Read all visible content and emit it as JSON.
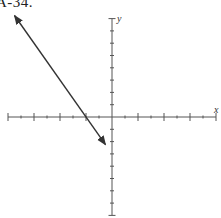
{
  "title": "A-34.",
  "chart_data": {
    "type": "line",
    "title": "A-34.",
    "xlabel": "x",
    "ylabel": "y",
    "xlim": [
      -8,
      8
    ],
    "ylim": [
      -8,
      8
    ],
    "grid": false,
    "tick_spacing": 1,
    "major_tick_every": 2,
    "tick_labels": [],
    "series": [
      {
        "name": "line",
        "equation": "y = -3/2 x - 3",
        "x_intercept": -2,
        "y_intercept": -3,
        "slope": -1.5,
        "points": [
          [
            -7.5,
            8.25
          ],
          [
            -2,
            0
          ],
          [
            -0.5,
            -2.25
          ]
        ],
        "arrows": "both"
      }
    ],
    "colors": {
      "axis": "#555555",
      "line": "#333333"
    }
  }
}
